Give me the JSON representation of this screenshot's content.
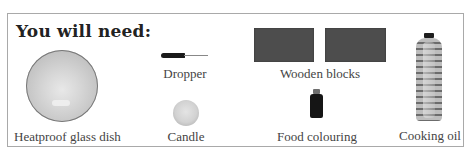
{
  "heading": "You will need:",
  "items": [
    {
      "name": "heatproof-glass-dish",
      "label": "Heatproof glass dish",
      "icon": "glass-dish-icon"
    },
    {
      "name": "dropper",
      "label": "Dropper",
      "icon": "dropper-icon"
    },
    {
      "name": "candle",
      "label": "Candle",
      "icon": "candle-icon"
    },
    {
      "name": "wooden-blocks",
      "label": "Wooden blocks",
      "icon": "wooden-block-icon"
    },
    {
      "name": "food-colouring",
      "label": "Food colouring",
      "icon": "food-colouring-bottle-icon"
    },
    {
      "name": "cooking-oil",
      "label": "Cooking oil",
      "icon": "oil-bottle-icon"
    }
  ],
  "colors": {
    "border": "#a9a9a9",
    "text": "#444444",
    "block": "#4d4d4d"
  }
}
